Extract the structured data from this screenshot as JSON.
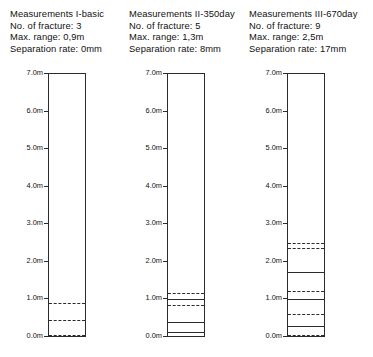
{
  "figure": {
    "axis": {
      "top_label": "7.0m",
      "bottom_label": "0.0m",
      "unit": "m",
      "max": 7.0,
      "min": 0.0,
      "tick_labels": [
        "7.0m",
        "6.0m",
        "5.0m",
        "4.0m",
        "3.0m",
        "2.0m",
        "1.0m",
        "0.0m"
      ],
      "tick_values": [
        7.0,
        6.0,
        5.0,
        4.0,
        3.0,
        2.0,
        1.0,
        0.0
      ]
    }
  },
  "chart_data": {
    "type": "table",
    "ylabel": "Depth / height (m)",
    "ylim": [
      0,
      7
    ],
    "grid": false,
    "legend": "none",
    "panels": [
      {
        "header": {
          "title": "Measurements I-basic",
          "fracture_line": "No. of fracture: 3",
          "range_line": "Max. range: 0,9m",
          "separation_line": "Separation rate: 0mm"
        },
        "no_of_fracture": 3,
        "max_range_m": 0.9,
        "separation_rate_mm": 0,
        "fractures": [
          {
            "position_m": 0.9,
            "style": "dashed"
          },
          {
            "position_m": 0.45,
            "style": "dashed"
          },
          {
            "position_m": 0.06,
            "style": "dashed"
          }
        ]
      },
      {
        "header": {
          "title": "Measurements II-350day",
          "fracture_line": "No. of fracture: 5",
          "range_line": "Max. range: 1,3m",
          "separation_line": "Separation rate: 8mm"
        },
        "no_of_fracture": 5,
        "max_range_m": 1.3,
        "separation_rate_mm": 8,
        "fractures": [
          {
            "position_m": 1.18,
            "style": "dashed"
          },
          {
            "position_m": 1.0,
            "style": "solid"
          },
          {
            "position_m": 0.84,
            "style": "dashed"
          },
          {
            "position_m": 0.4,
            "style": "solid"
          },
          {
            "position_m": 0.12,
            "style": "solid"
          }
        ]
      },
      {
        "header": {
          "title": "Measurements III-670day",
          "fracture_line": "No. of fracture: 9",
          "range_line": "Max. range: 2,5m",
          "separation_line": "Separation rate: 17mm"
        },
        "no_of_fracture": 9,
        "max_range_m": 2.5,
        "separation_rate_mm": 17,
        "fractures": [
          {
            "position_m": 2.5,
            "style": "dashed"
          },
          {
            "position_m": 2.36,
            "style": "dashed"
          },
          {
            "position_m": 1.74,
            "style": "solid"
          },
          {
            "position_m": 1.22,
            "style": "dashed"
          },
          {
            "position_m": 1.02,
            "style": "solid"
          },
          {
            "position_m": 0.62,
            "style": "dashed"
          },
          {
            "position_m": 0.3,
            "style": "solid"
          },
          {
            "position_m": 0.06,
            "style": "dashed"
          }
        ]
      }
    ]
  }
}
